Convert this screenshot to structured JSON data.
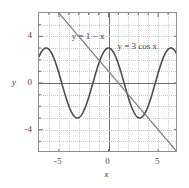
{
  "chart_data": {
    "type": "line",
    "title": "",
    "subtitle": "",
    "xlabel": "x",
    "ylabel": "y",
    "xlim": [
      -7,
      7
    ],
    "ylim": [
      -6,
      6
    ],
    "grid": true,
    "grid_style": "dotted",
    "legend_position": "inline-annotations",
    "background": "#ffffff",
    "frame_color": "#8e8e8e",
    "axis_color": "#6f6f6f",
    "grid_color": "#c9c9c9",
    "xticks": [
      -5,
      0,
      5
    ],
    "xtick_labels": [
      "-5",
      "0",
      "5"
    ],
    "yticks": [
      -4,
      0,
      4
    ],
    "ytick_labels": [
      "-4",
      "0",
      "4"
    ],
    "x_minor_ticks": [
      -6,
      -4,
      -3,
      -2,
      -1,
      1,
      2,
      3,
      4,
      6
    ],
    "y_minor_ticks": [
      -5,
      -3,
      -2,
      -1,
      1,
      2,
      3,
      5
    ],
    "series": [
      {
        "name": "y = 3 cos x",
        "expression": "3*cos(x)",
        "color": "#4d4d4d",
        "width": 1.6,
        "annotation": "y = 3 cos x",
        "annotation_x": 1.0,
        "annotation_y": 3.55,
        "amplitude": 3,
        "period": 6.283185307179586
      },
      {
        "name": "y = 1 - x",
        "expression": "1 - x",
        "color": "#7a7a7a",
        "width": 1.2,
        "annotation": "y = 1 − x",
        "annotation_x": -3.6,
        "annotation_y": 4.35,
        "slope": -1,
        "intercept": 1
      }
    ]
  },
  "annotations": {
    "line_label": "y = 1 − x",
    "cos_label": "y = 3 cos x"
  },
  "axes": {
    "x_name": "x",
    "y_name": "y"
  }
}
